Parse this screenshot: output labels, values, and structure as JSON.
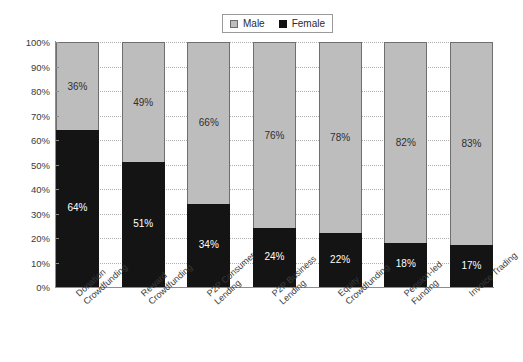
{
  "chart_data": {
    "type": "bar",
    "subtype": "stacked-bar-100",
    "title": "",
    "xlabel": "",
    "ylabel": "",
    "ylim": [
      0,
      100
    ],
    "yunit": "%",
    "grid": true,
    "legend_position": "top-center",
    "orientation": "vertical",
    "categories": [
      "Donation Crowdfunding",
      "Reward Crowdfunding",
      "P2P Consumer Lending",
      "P2P Business Lending",
      "Equity Crowdfunding",
      "Pension-led Funding",
      "Invoice Trading"
    ],
    "category_lines": [
      [
        "Donation",
        "Crowdfunding"
      ],
      [
        "Reward",
        "Crowdfunding"
      ],
      [
        "P2P Consumer",
        "Lending"
      ],
      [
        "P2P Business",
        "Lending"
      ],
      [
        "Equity",
        "Crowdfunding"
      ],
      [
        "Pension-led",
        "Funding"
      ],
      [
        "Invoice Trading"
      ]
    ],
    "series": [
      {
        "name": "Male",
        "color": "#bdbdbd",
        "values": [
          36,
          49,
          66,
          76,
          78,
          82,
          83
        ],
        "labels": [
          "36%",
          "49%",
          "66%",
          "76%",
          "78%",
          "82%",
          "83%"
        ]
      },
      {
        "name": "Female",
        "color": "#141414",
        "values": [
          64,
          51,
          34,
          24,
          22,
          18,
          17
        ],
        "labels": [
          "64%",
          "51%",
          "34%",
          "24%",
          "22%",
          "18%",
          "17%"
        ]
      }
    ],
    "yticks": [
      100,
      90,
      80,
      70,
      60,
      50,
      40,
      30,
      20,
      10,
      0
    ],
    "ytick_labels": [
      "100%",
      "90%",
      "80%",
      "70%",
      "60%",
      "50%",
      "40%",
      "30%",
      "20%",
      "10%",
      "0%"
    ]
  },
  "legend": {
    "items": [
      {
        "label": "Male",
        "color": "#bdbdbd"
      },
      {
        "label": "Female",
        "color": "#141414"
      }
    ]
  }
}
